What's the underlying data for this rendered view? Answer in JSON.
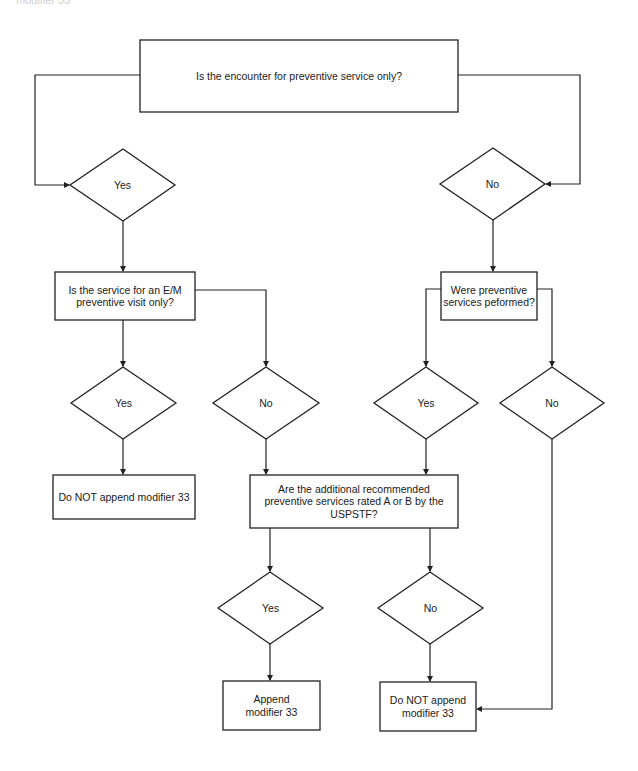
{
  "header_fragment": "modifier 33",
  "colors": {
    "stroke": "#222222",
    "text": "#1a1a1a",
    "background": "#ffffff"
  },
  "nodes": {
    "q1": {
      "type": "process",
      "text": "Is the encounter for preventive service only?"
    },
    "d_yes1": {
      "type": "decision",
      "text": "Yes"
    },
    "d_no1": {
      "type": "decision",
      "text": "No"
    },
    "q2": {
      "type": "process",
      "text": "Is the service for an E/M preventive visit only?"
    },
    "q3": {
      "type": "process",
      "text": "Were preventive services peformed?"
    },
    "d_yes2": {
      "type": "decision",
      "text": "Yes"
    },
    "d_no2": {
      "type": "decision",
      "text": "No"
    },
    "d_yes3": {
      "type": "decision",
      "text": "Yes"
    },
    "d_no3": {
      "type": "decision",
      "text": "No"
    },
    "r1": {
      "type": "terminal",
      "text": "Do NOT append modifier 33"
    },
    "q4": {
      "type": "process",
      "text": "Are the additional recommended preventive services rated A or B by the USPSTF?"
    },
    "d_yes4": {
      "type": "decision",
      "text": "Yes"
    },
    "d_no4": {
      "type": "decision",
      "text": "No"
    },
    "r2": {
      "type": "terminal",
      "text": "Append modifier 33"
    },
    "r3": {
      "type": "terminal",
      "text": "Do NOT append modifier 33"
    }
  },
  "edges": [
    [
      "q1",
      "d_yes1"
    ],
    [
      "q1",
      "d_no1"
    ],
    [
      "d_yes1",
      "q2"
    ],
    [
      "d_no1",
      "q3"
    ],
    [
      "q2",
      "d_yes2"
    ],
    [
      "q2",
      "d_no2"
    ],
    [
      "q3",
      "d_yes3"
    ],
    [
      "q3",
      "d_no3"
    ],
    [
      "d_yes2",
      "r1"
    ],
    [
      "d_no2",
      "q4"
    ],
    [
      "d_yes3",
      "q4"
    ],
    [
      "d_no3",
      "r3"
    ],
    [
      "q4",
      "d_yes4"
    ],
    [
      "q4",
      "d_no4"
    ],
    [
      "d_yes4",
      "r2"
    ],
    [
      "d_no4",
      "r3"
    ]
  ]
}
